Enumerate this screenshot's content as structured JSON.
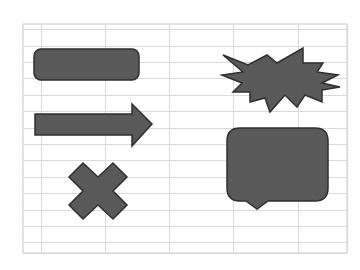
{
  "spreadsheet": {
    "grid": {
      "left": 23,
      "top": 24,
      "right": 347,
      "bottom": 253,
      "header_row_y": 29,
      "column_lines_x": [
        41,
        105,
        169,
        233,
        298
      ],
      "row_lines_y": [
        46,
        62,
        78,
        95,
        111,
        128,
        144,
        160,
        177,
        193,
        210,
        226,
        242
      ],
      "line_color": "#d9d9d9",
      "border_color": "#c8c8c8"
    },
    "shapes": [
      {
        "name": "rounded-rectangle",
        "type": "rounded-rectangle"
      },
      {
        "name": "right-arrow",
        "type": "right-arrow"
      },
      {
        "name": "multiply-sign",
        "type": "multiply"
      },
      {
        "name": "explosion",
        "type": "explosion"
      },
      {
        "name": "speech-bubble",
        "type": "rounded-rectangular-callout"
      }
    ],
    "shape_fill": "#595959",
    "shape_stroke": "#2f2f2f"
  }
}
